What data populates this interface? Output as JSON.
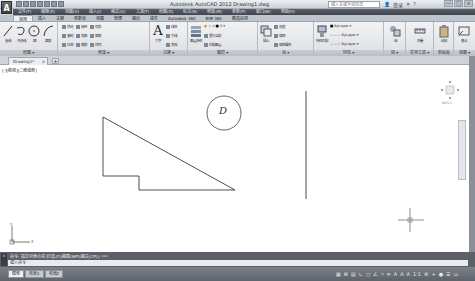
{
  "titlebar": {
    "app_letter": "A",
    "title": "Autodesk AutoCAD 2012  Drawing1.dwg",
    "search_placeholder": "键入关键字或短语",
    "sign_in": "登录",
    "window_controls": [
      "—",
      "□",
      "×"
    ]
  },
  "menubar": {
    "items": [
      "文件(F)",
      "编辑(E)",
      "视图(V)",
      "插入(I)",
      "格式(O)",
      "工具(T)",
      "绘图(D)",
      "标注(N)",
      "修改(M)",
      "参数(P)",
      "窗口(W)",
      "帮助(H)"
    ]
  },
  "ribbon_tabs": {
    "tabs": [
      "常用",
      "插入",
      "注释",
      "参数化",
      "视图",
      "管理",
      "输出",
      "插件",
      "Autodesk 360",
      "BIM 360",
      "精选应用"
    ],
    "active_index": 0
  },
  "ribbon": {
    "panels": [
      {
        "title": "绘图 ▾",
        "big_tools": [
          "直线",
          "多段线",
          "圆",
          "圆弧"
        ]
      },
      {
        "title": "修改 ▾",
        "rows": [
          [
            "移动",
            "旋转",
            "修剪"
          ],
          [
            "复制",
            "镜像",
            "圆角"
          ],
          [
            "拉伸",
            "缩放",
            "阵列"
          ]
        ]
      },
      {
        "title": "注释 ▾",
        "big_tools": [
          "文字"
        ],
        "rows": [
          [
            "线性"
          ],
          [
            "引线"
          ],
          [
            "表格"
          ]
        ]
      },
      {
        "title": "图层 ▾",
        "big_tools": [
          "图层特性"
        ],
        "rows": [
          [
            "置为当前"
          ],
          [
            "匹配图层"
          ]
        ],
        "layer_value": "0"
      },
      {
        "title": "块 ▾",
        "big_tools": [
          "插入"
        ],
        "rows": [
          [
            "创建"
          ],
          [
            "编辑"
          ],
          [
            "编辑属性"
          ]
        ]
      },
      {
        "title": "特性 ▾",
        "big_tools": [
          "特性匹配"
        ],
        "rows": [
          [
            "ByLayer"
          ],
          [
            "ByLayer"
          ],
          [
            "ByLayer"
          ]
        ]
      },
      {
        "title": "组 ▾",
        "big_tools": [
          "组"
        ]
      },
      {
        "title": "实用工具 ▾",
        "big_tools": [
          "测量"
        ]
      },
      {
        "title": "剪贴板",
        "big_tools": [
          "粘贴"
        ]
      },
      {
        "title": "视图 ▾",
        "big_tools": [
          "基点"
        ]
      }
    ]
  },
  "doc_tabs": {
    "tabs": [
      {
        "label": "Drawing1*",
        "close": "×"
      }
    ],
    "new_tab": "+"
  },
  "canvas": {
    "viewport_label": "[-][俯视][二维线框]",
    "circle_label": "D",
    "ucs_x": "X",
    "ucs_y": "Y",
    "viewcube_label": "WCS ▾"
  },
  "command": {
    "history": "命令: 指定对角点或 [栏选(F)/圈围(WP)/圈交(CP)]:  ***",
    "prompt": "键入命令",
    "side_icons": [
      "×",
      "↕"
    ]
  },
  "statusbar": {
    "layout_tabs": [
      "模型",
      "布局1",
      "布局2"
    ],
    "active_layout": 0,
    "tools": [
      "▦",
      "⊞",
      "▤",
      "∟",
      "◻",
      "∠",
      "⌗",
      "≡",
      "A",
      "A",
      "A",
      "1:1",
      "⚙",
      "+",
      "●",
      "☰",
      "▭"
    ]
  }
}
